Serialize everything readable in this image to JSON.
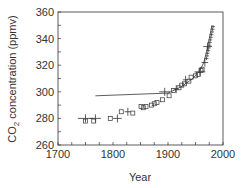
{
  "chart_data": {
    "type": "scatter",
    "title": "",
    "xlabel": "Year",
    "ylabel": "CO2 concentration (ppmv)",
    "ylabel_parts": {
      "pre": "CO",
      "sub": "2",
      "post": " concentration (ppmv)"
    },
    "xlim": [
      1700,
      2000
    ],
    "ylim": [
      260,
      360
    ],
    "xticks": [
      1700,
      1800,
      1900,
      2000
    ],
    "yticks": [
      260,
      280,
      300,
      320,
      340,
      360
    ],
    "x_minor_step": 25,
    "y_minor_step": 10,
    "grid": false,
    "legend": null,
    "series": [
      {
        "name": "Ice core (squares)",
        "marker": "square",
        "points": [
          [
            1750,
            278
          ],
          [
            1765,
            278
          ],
          [
            1795,
            280
          ],
          [
            1815,
            285
          ],
          [
            1836,
            284
          ],
          [
            1851,
            289
          ],
          [
            1855,
            288
          ],
          [
            1860,
            289
          ],
          [
            1870,
            290
          ],
          [
            1875,
            291
          ],
          [
            1880,
            292
          ],
          [
            1890,
            294
          ],
          [
            1902,
            297
          ],
          [
            1910,
            301
          ],
          [
            1920,
            303
          ],
          [
            1925,
            305
          ],
          [
            1930,
            306
          ],
          [
            1938,
            308
          ],
          [
            1942,
            311
          ],
          [
            1950,
            312
          ],
          [
            1955,
            313
          ],
          [
            1960,
            316
          ],
          [
            1962,
            317
          ]
        ]
      },
      {
        "name": "Ice core (crosses)",
        "marker": "cross",
        "points": [
          [
            1750,
            280,
            14
          ],
          [
            1768,
            280,
            10
          ],
          [
            1808,
            280,
            8
          ],
          [
            1827,
            285,
            6
          ],
          [
            1894,
            300,
            10
          ],
          [
            1915,
            302,
            5
          ],
          [
            1932,
            309,
            5
          ],
          [
            1958,
            315,
            10
          ],
          [
            1967,
            322,
            6
          ],
          [
            1972,
            334,
            8
          ]
        ]
      },
      {
        "name": "Mauna Loa atmospheric",
        "marker": "plus-small",
        "points": [
          [
            1970,
            325
          ],
          [
            1971,
            327
          ],
          [
            1972,
            329
          ],
          [
            1973,
            331
          ],
          [
            1974,
            333
          ],
          [
            1975,
            335
          ],
          [
            1976,
            337
          ],
          [
            1977,
            339
          ],
          [
            1978,
            341
          ],
          [
            1979,
            343
          ],
          [
            1980,
            345
          ],
          [
            1981,
            347
          ],
          [
            1982,
            349
          ]
        ]
      },
      {
        "name": "Fitted line",
        "marker": "line",
        "points": [
          [
            1768,
            297
          ],
          [
            1900,
            299
          ],
          [
            1925,
            304
          ],
          [
            1945,
            310
          ],
          [
            1958,
            316
          ],
          [
            1965,
            322
          ],
          [
            1970,
            330
          ],
          [
            1975,
            340
          ],
          [
            1980,
            350
          ]
        ]
      }
    ]
  }
}
